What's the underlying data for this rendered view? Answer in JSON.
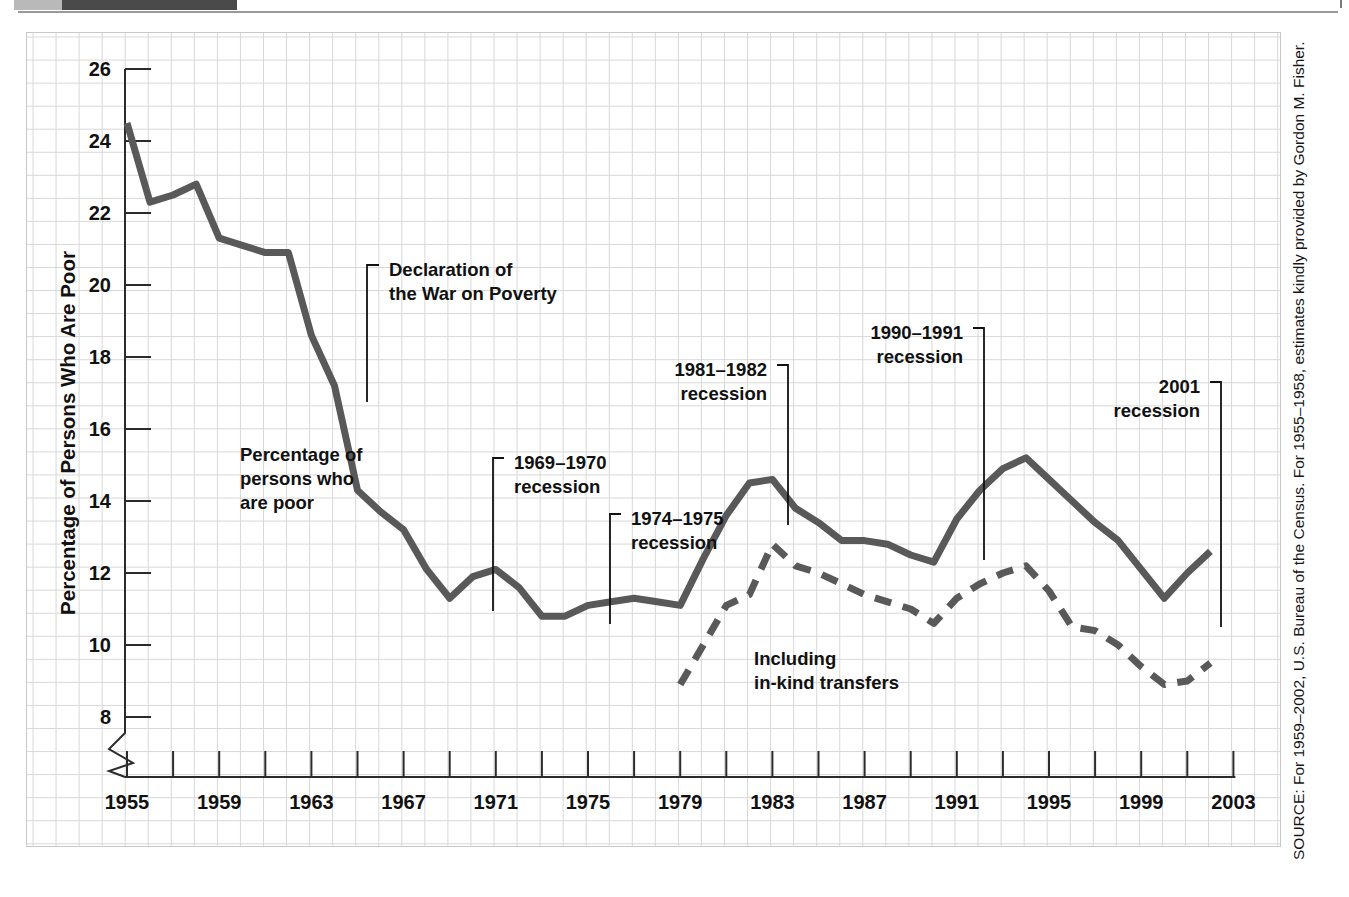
{
  "figure": {
    "source_note": "SOURCE: For 1959–2002, U.S. Bureau of the Census. For 1955–1958, estimates kindly provided by Gordon M. Fisher."
  },
  "colors": {
    "series_line": "#595959",
    "grid": "#d8d8d8",
    "axis": "#2b2b2b",
    "text": "#111111",
    "panel_border": "#c8c8c8",
    "header_dark": "#4a4a4a",
    "header_light": "#b9b9b9"
  },
  "chart_data": {
    "type": "line",
    "title": "",
    "xlabel": "",
    "ylabel": "Percentage of Persons Who Are Poor",
    "xlim": [
      1955,
      2003
    ],
    "ylim": [
      7,
      26
    ],
    "y_axis_break": true,
    "grid": true,
    "legend": "inline-annotations",
    "y_ticks": [
      8,
      10,
      12,
      14,
      16,
      18,
      20,
      22,
      24,
      26
    ],
    "x_ticks": [
      1955,
      1957,
      1959,
      1961,
      1963,
      1965,
      1967,
      1969,
      1971,
      1973,
      1975,
      1977,
      1979,
      1981,
      1983,
      1985,
      1987,
      1989,
      1991,
      1993,
      1995,
      1997,
      1999,
      2001,
      2003
    ],
    "x_tick_labels": [
      1955,
      1959,
      1963,
      1967,
      1971,
      1975,
      1979,
      1983,
      1987,
      1991,
      1995,
      1999,
      2003
    ],
    "series": [
      {
        "name": "Percentage of persons who are poor",
        "style": "solid",
        "x": [
          1955,
          1956,
          1957,
          1958,
          1959,
          1960,
          1961,
          1962,
          1963,
          1964,
          1965,
          1966,
          1967,
          1968,
          1969,
          1970,
          1971,
          1972,
          1973,
          1974,
          1975,
          1976,
          1977,
          1978,
          1979,
          1980,
          1981,
          1982,
          1983,
          1984,
          1985,
          1986,
          1987,
          1988,
          1989,
          1990,
          1991,
          1992,
          1993,
          1994,
          1995,
          1996,
          1997,
          1998,
          1999,
          2000,
          2001,
          2002
        ],
        "values": [
          24.5,
          22.3,
          22.5,
          22.8,
          21.3,
          21.1,
          20.9,
          20.9,
          18.6,
          17.2,
          14.3,
          13.7,
          13.2,
          12.1,
          11.3,
          11.9,
          12.1,
          11.6,
          10.8,
          10.8,
          11.1,
          11.2,
          11.3,
          11.2,
          11.1,
          12.4,
          13.6,
          14.5,
          14.6,
          13.8,
          13.4,
          12.9,
          12.9,
          12.8,
          12.5,
          12.3,
          13.5,
          14.3,
          14.9,
          15.2,
          14.6,
          14.0,
          13.4,
          12.9,
          12.1,
          11.3,
          12.0,
          12.6
        ]
      },
      {
        "name": "Including in-kind transfers",
        "style": "dashed",
        "x": [
          1979,
          1980,
          1981,
          1982,
          1983,
          1984,
          1985,
          1986,
          1987,
          1988,
          1989,
          1990,
          1991,
          1992,
          1993,
          1994,
          1995,
          1996,
          1997,
          1998,
          1999,
          2000,
          2001,
          2002
        ],
        "values": [
          8.9,
          10.0,
          11.1,
          11.4,
          12.8,
          12.2,
          12.0,
          11.7,
          11.4,
          11.2,
          11.0,
          10.6,
          11.3,
          11.7,
          12.0,
          12.2,
          11.5,
          10.5,
          10.4,
          10.0,
          9.4,
          8.9,
          9.0,
          9.5
        ]
      }
    ],
    "annotations": [
      {
        "id": "declaration-war-on-poverty",
        "lines": [
          "Declaration of",
          "the War on Poverty"
        ],
        "text_x": 362,
        "text_y": 243,
        "leader": "M 352 232 L 340 232 L 340 369",
        "align": "start"
      },
      {
        "id": "series-label-poor",
        "lines": [
          "Percentage of",
          "persons who",
          "are poor"
        ],
        "text_x": 213,
        "text_y": 428,
        "leader": "",
        "align": "start"
      },
      {
        "id": "recession-1969-1970",
        "lines": [
          "1969–1970",
          "recession"
        ],
        "text_x": 487,
        "text_y": 436,
        "leader": "M 477 425 L 466 425 L 466 578",
        "align": "start"
      },
      {
        "id": "recession-1974-1975",
        "lines": [
          "1974–1975",
          "recession"
        ],
        "text_x": 604,
        "text_y": 492,
        "leader": "M 594 481 L 583 481 L 583 591",
        "align": "start"
      },
      {
        "id": "recession-1981-1982",
        "lines": [
          "1981–1982",
          "recession"
        ],
        "text_x": 740,
        "text_y": 343,
        "leader": "M 750 332 L 761 332 L 761 492",
        "align": "end"
      },
      {
        "id": "recession-1990-1991",
        "lines": [
          "1990–1991",
          "recession"
        ],
        "text_x": 936,
        "text_y": 306,
        "leader": "M 946 295 L 957 295 L 957 527",
        "align": "end"
      },
      {
        "id": "recession-2001",
        "lines": [
          "2001",
          "recession"
        ],
        "text_x": 1173,
        "text_y": 360,
        "leader": "M 1183 349 L 1194 349 L 1194 594",
        "align": "end"
      },
      {
        "id": "series-label-in-kind",
        "lines": [
          "Including",
          "in-kind transfers"
        ],
        "text_x": 727,
        "text_y": 632,
        "leader": "",
        "align": "start"
      }
    ]
  }
}
